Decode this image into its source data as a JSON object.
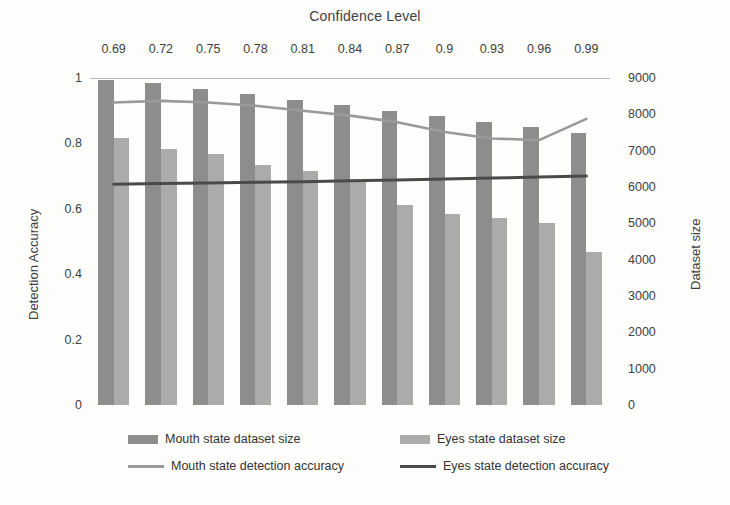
{
  "chart_data": {
    "type": "bar",
    "title": "Confidence Level",
    "xlabel": "Confidence Level",
    "ylabel": "Detection Accuracy",
    "y2label": "Dataset size",
    "grid": false,
    "legend_position": "bottom",
    "categories": [
      "0.69",
      "0.72",
      "0.75",
      "0.78",
      "0.81",
      "0.84",
      "0.87",
      "0.9",
      "0.93",
      "0.96",
      "0.99"
    ],
    "ylim": [
      0,
      1
    ],
    "y2lim": [
      0,
      9000
    ],
    "yticks": [
      "0",
      "0.2",
      "0.4",
      "0.6",
      "0.8",
      "1"
    ],
    "ytick_values": [
      0,
      0.2,
      0.4,
      0.6,
      0.8,
      1
    ],
    "y2ticks": [
      "0",
      "1000",
      "2000",
      "3000",
      "4000",
      "5000",
      "6000",
      "7000",
      "8000",
      "9000"
    ],
    "y2tick_values": [
      0,
      1000,
      2000,
      3000,
      4000,
      5000,
      6000,
      7000,
      8000,
      9000
    ],
    "series": [
      {
        "name": "Mouth state dataset size",
        "type": "bar",
        "axis": "right",
        "color": "#8d8d8d",
        "values": [
          8950,
          8850,
          8700,
          8550,
          8400,
          8250,
          8100,
          7950,
          7800,
          7650,
          7500
        ]
      },
      {
        "name": "Eyes state dataset size",
        "type": "bar",
        "axis": "right",
        "color": "#ababab",
        "values": [
          7350,
          7050,
          6900,
          6600,
          6450,
          6150,
          5500,
          5250,
          5150,
          5000,
          4200
        ]
      },
      {
        "name": "Mouth state detection accuracy",
        "type": "line",
        "axis": "left",
        "color": "#9a9a9a",
        "values": [
          0.925,
          0.93,
          0.925,
          0.915,
          0.9,
          0.885,
          0.865,
          0.835,
          0.815,
          0.81,
          0.875
        ]
      },
      {
        "name": "Eyes state detection accuracy",
        "type": "line",
        "axis": "left",
        "color": "#4a4a4a",
        "values": [
          0.675,
          0.677,
          0.679,
          0.681,
          0.683,
          0.686,
          0.688,
          0.691,
          0.694,
          0.697,
          0.7
        ]
      }
    ]
  },
  "legend": {
    "items": [
      {
        "label": "Mouth state dataset size",
        "marker": "bar",
        "key": "mouth"
      },
      {
        "label": "Eyes state dataset size",
        "marker": "bar",
        "key": "eyes"
      },
      {
        "label": "Mouth state detection accuracy",
        "marker": "line",
        "key": "mouth"
      },
      {
        "label": "Eyes state detection accuracy",
        "marker": "line",
        "key": "eyes"
      }
    ]
  }
}
